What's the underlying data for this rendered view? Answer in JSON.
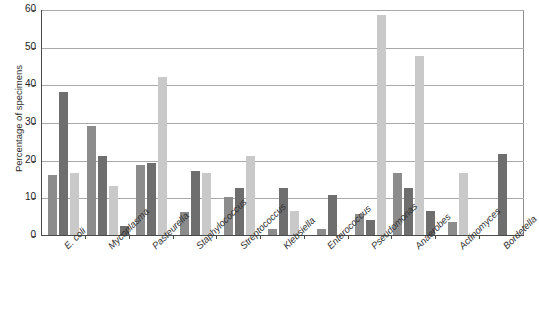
{
  "chart_data": {
    "type": "bar",
    "title": "",
    "subtitle": "",
    "xlabel": "",
    "ylabel": "Percentage of specimens",
    "ylim": [
      0,
      60
    ],
    "yticks": [
      0,
      10,
      20,
      30,
      40,
      50,
      60
    ],
    "grid": true,
    "legend": "none",
    "categories": [
      "E. coli",
      "Mycoplasma",
      "Pasteurella",
      "Staphylococcus",
      "Streptococcus",
      "Klebsiella",
      "Enterococcus",
      "Pseudomonas",
      "Anaerobes",
      "Actinomyces",
      "Bordetella"
    ],
    "series": [
      {
        "name": "series-1",
        "color": "#8c8c8c",
        "values": [
          16,
          29,
          18.5,
          6,
          10,
          1.5,
          1.5,
          5.5,
          16.5,
          3.5,
          0
        ]
      },
      {
        "name": "series-2",
        "color": "#6e6e6e",
        "values": [
          38,
          21,
          19,
          17,
          12.5,
          12.5,
          10.5,
          4,
          12.5,
          0,
          21.5
        ]
      },
      {
        "name": "series-3",
        "color": "#c9c9c9",
        "values": [
          16.5,
          13,
          42,
          16.5,
          21,
          6.5,
          0,
          58.5,
          47.5,
          16.5,
          0
        ]
      },
      {
        "name": "series-4",
        "color": "#6e6e6e",
        "values": [
          0,
          2.5,
          0,
          0,
          0,
          0,
          0,
          0,
          6.5,
          0,
          0
        ]
      }
    ]
  }
}
